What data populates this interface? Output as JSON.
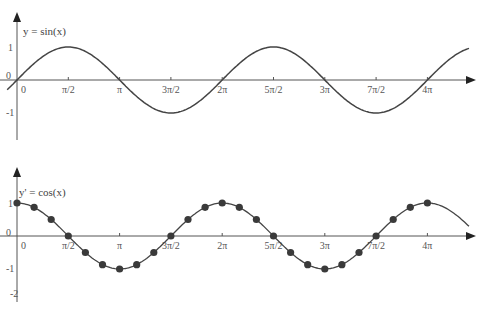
{
  "chart_data": [
    {
      "type": "line",
      "title": "y = sin(x)",
      "series": [
        {
          "name": "y = sin(x)",
          "function": "sin",
          "markers": false
        }
      ],
      "xlabel": "",
      "ylabel": "",
      "xticks": [
        "0",
        "π/2",
        "π",
        "3π/2",
        "2π",
        "5π/2",
        "3π",
        "7π/2",
        "4π"
      ],
      "yticks": [
        "1",
        "0",
        "-1"
      ],
      "xlim": [
        -0.2,
        14.5
      ],
      "ylim": [
        -1.8,
        1.6
      ],
      "grid": false
    },
    {
      "type": "scatter",
      "title": "y' = cos(x)",
      "series": [
        {
          "name": "y' = cos(x)",
          "function": "cos",
          "markers": true,
          "marker_step": "π/6",
          "x": [
            0,
            0.5236,
            1.0472,
            1.5708,
            2.0944,
            2.618,
            3.1416,
            3.6652,
            4.1888,
            4.7124,
            5.236,
            5.7596,
            6.2832,
            6.8068,
            7.3304,
            7.854,
            8.3776,
            8.9012,
            9.4248,
            9.9484,
            10.472,
            10.9956,
            11.5192,
            12.0428,
            12.5664
          ],
          "y": [
            1,
            0.87,
            0.5,
            0,
            -0.5,
            -0.87,
            -1,
            -0.87,
            -0.5,
            0,
            0.5,
            0.87,
            1,
            0.87,
            0.5,
            0,
            -0.5,
            -0.87,
            -1,
            -0.87,
            -0.5,
            0,
            0.5,
            0.87,
            1
          ]
        }
      ],
      "xticks": [
        "0",
        "π/2",
        "π",
        "3π/2",
        "2π",
        "5π/2",
        "3π",
        "7π/2",
        "4π"
      ],
      "yticks": [
        "1",
        "0",
        "-1",
        "-2"
      ],
      "xlim": [
        -0.2,
        14.5
      ],
      "ylim": [
        -2.2,
        1.6
      ],
      "grid": false
    }
  ],
  "top": {
    "title": "y = sin(x)",
    "y_ticks": [
      "1",
      "0",
      "-1"
    ],
    "x_ticks": [
      "0",
      "π/2",
      "π",
      "3π/2",
      "2π",
      "5π/2",
      "3π",
      "7π/2",
      "4π"
    ]
  },
  "bottom": {
    "title": "y' = cos(x)",
    "y_ticks": [
      "1",
      "0",
      "-1",
      "-2"
    ],
    "x_ticks": [
      "0",
      "π/2",
      "π",
      "3π/2",
      "2π",
      "5π/2",
      "3π",
      "7π/2",
      "4π"
    ]
  }
}
